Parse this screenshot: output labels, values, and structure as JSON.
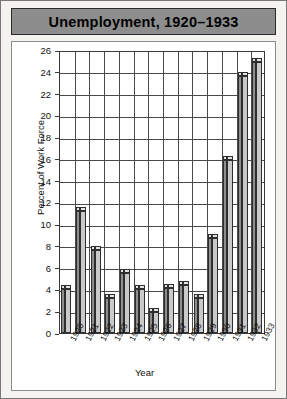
{
  "title": "Unemployment, 1920–1933",
  "colors": {
    "title_bar": "#8d8d8d",
    "page_bg": "#f4f3f0",
    "plot_bg": "#ffffff",
    "bar_front": "#c9c9c9",
    "bar_top": "#e3e3e3",
    "bar_side": "#8e8e8e",
    "axis": "#3a3a3a",
    "grid": "#4a4a4a"
  },
  "chart_data": {
    "type": "bar",
    "title": "Unemployment, 1920–1933",
    "xlabel": "Year",
    "ylabel": "Percent of Work Force",
    "categories": [
      "1920",
      "1921",
      "1922",
      "1923",
      "1924",
      "1925",
      "1926",
      "1927",
      "1928",
      "1929",
      "1930",
      "1931",
      "1932",
      "1933"
    ],
    "values": [
      4.0,
      11.2,
      7.6,
      3.2,
      5.5,
      4.0,
      1.9,
      4.1,
      4.4,
      3.2,
      8.7,
      15.9,
      23.6,
      24.9
    ],
    "ylim": [
      0,
      26
    ],
    "yticks": [
      0,
      2,
      4,
      6,
      8,
      10,
      12,
      14,
      16,
      18,
      20,
      22,
      24,
      26
    ],
    "ytick_labels": [
      "0",
      "2",
      "4",
      "6",
      "8",
      "10",
      "12",
      "14",
      "16",
      "18",
      "20",
      "22",
      "24",
      "26"
    ],
    "grid": true,
    "legend": false,
    "style": "3d-bars"
  }
}
